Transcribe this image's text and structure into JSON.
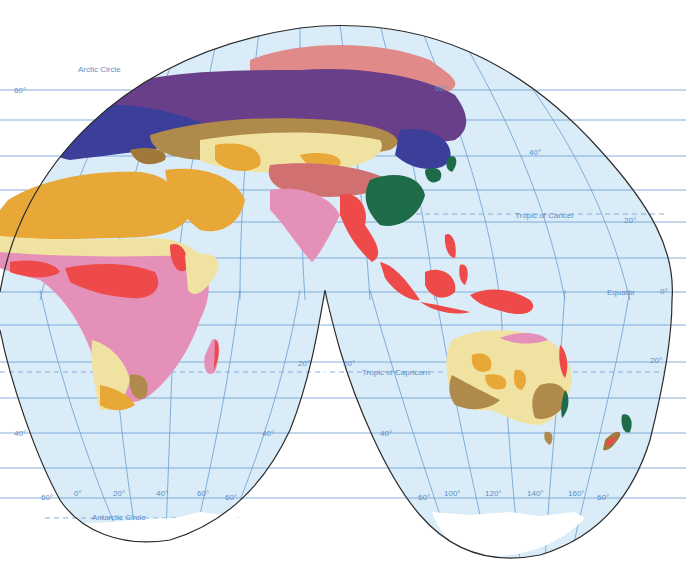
{
  "map": {
    "projection": "interrupted homolosine (Eastern Hemisphere lobes)",
    "colors": {
      "ocean": "#d9ecf8",
      "graticule": "#6a9dd0",
      "outline": "#2b2b2b",
      "ice": "#ffffff",
      "tundra": "#e08a8a",
      "taiga": "#6a3f8a",
      "mixed_forest": "#3b3f9a",
      "steppe": "#b08a4a",
      "semi_desert": "#f0e2a0",
      "desert": "#e8a838",
      "savanna": "#e590b8",
      "rainforest": "#ef4a4a",
      "humid_subtropical": "#1e6b4a",
      "mediterranean": "#a0783a",
      "highland": "#d07070"
    },
    "labels": {
      "arctic_circle": "Arctic Circle",
      "tropic_of_cancer": "Tropic of Cancer",
      "equator": "Equator",
      "tropic_of_capricorn": "Tropic of Capricorn",
      "antarctic_circle": "Antarctic Circle"
    },
    "lat_labels": {
      "n60_left": "60°",
      "n60_right": "60°",
      "n40_right": "40°",
      "n20_right": "20°",
      "eq_right": "0°",
      "s20_left_lobe_right": "20°",
      "s20_right_lobe_left": "20°",
      "s20_right_lobe_right": "20°",
      "s40_left": "40°",
      "s40_left_lobe_right": "40°",
      "s40_right_lobe_left": "40°",
      "s60_left": "60°",
      "s60_left_lobe_right": "60°",
      "s60_right_lobe_left": "60°",
      "s60_right_lobe_right": "60°"
    },
    "lon_labels_left_lobe": [
      "0°",
      "20°",
      "40°",
      "60°"
    ],
    "lon_labels_right_lobe": [
      "100°",
      "120°",
      "140°",
      "160°"
    ]
  }
}
